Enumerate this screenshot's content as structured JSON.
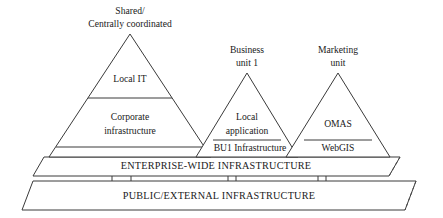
{
  "diagram": {
    "colors": {
      "stroke": "#3a3a3a",
      "text": "#1a1a1a",
      "background": "#ffffff",
      "dashed_stroke": "#4a4a4a"
    },
    "pyramids": [
      {
        "id": "shared-central",
        "caption_line1": "Shared/",
        "caption_line2": "Centrally coordinated",
        "layers": [
          {
            "id": "local-it",
            "label": "Local IT"
          },
          {
            "id": "corporate-infrastructure-line1",
            "label": "Corporate"
          },
          {
            "id": "corporate-infrastructure-line2",
            "label": "infrastructure"
          }
        ]
      },
      {
        "id": "business-unit-1",
        "caption_line1": "Business",
        "caption_line2": "unit 1",
        "layers": [
          {
            "id": "local-application-line1",
            "label": "Local"
          },
          {
            "id": "local-application-line2",
            "label": "application"
          },
          {
            "id": "bu1-infrastructure",
            "label": "BU1 Infrastructure"
          }
        ]
      },
      {
        "id": "marketing-unit",
        "caption_line1": "Marketing",
        "caption_line2": "unit",
        "layers": [
          {
            "id": "omas",
            "label": "OMAS"
          },
          {
            "id": "webgis",
            "label": "WebGIS"
          }
        ]
      }
    ],
    "bands": [
      {
        "id": "enterprise-wide",
        "label": "ENTERPRISE-WIDE INFRASTRUCTURE"
      },
      {
        "id": "public-external",
        "label": "PUBLIC/EXTERNAL INFRASTRUCTURE"
      }
    ]
  }
}
